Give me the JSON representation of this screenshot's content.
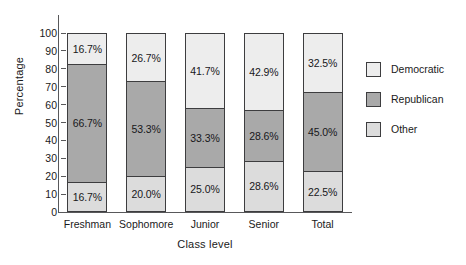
{
  "chart_data": {
    "type": "bar",
    "subtype": "stacked-bar-100-percent",
    "title": "",
    "xlabel": "Class level",
    "ylabel": "Percentage",
    "ylim": [
      0,
      100
    ],
    "yticks": [
      0,
      10,
      20,
      30,
      40,
      50,
      60,
      70,
      80,
      90,
      100
    ],
    "ytick_labels": [
      "0",
      "10",
      "20",
      "30",
      "40",
      "50",
      "60",
      "70",
      "80",
      "90",
      "100"
    ],
    "grid": false,
    "legend_position": "right",
    "categories": [
      "Freshman",
      "Sophomore",
      "Junior",
      "Senior",
      "Total"
    ],
    "series": [
      {
        "name": "Democratic",
        "color": "#ededed",
        "values": [
          16.7,
          26.7,
          41.7,
          42.9,
          32.5
        ],
        "labels": [
          "16.7%",
          "26.7%",
          "41.7%",
          "42.9%",
          "32.5%"
        ]
      },
      {
        "name": "Republican",
        "color": "#a9a9a9",
        "values": [
          66.7,
          53.3,
          33.3,
          28.6,
          45.0
        ],
        "labels": [
          "66.7%",
          "53.3%",
          "33.3%",
          "28.6%",
          "45.0%"
        ]
      },
      {
        "name": "Other",
        "color": "#dcdcdc",
        "values": [
          16.7,
          20.0,
          25.0,
          28.6,
          22.5
        ],
        "labels": [
          "16.7%",
          "20.0%",
          "25.0%",
          "28.6%",
          "22.5%"
        ]
      }
    ],
    "stack_order_top_to_bottom": [
      "Democratic",
      "Republican",
      "Other"
    ]
  },
  "legend": {
    "items": [
      {
        "label": "Democratic",
        "color": "#ededed"
      },
      {
        "label": "Republican",
        "color": "#a9a9a9"
      },
      {
        "label": "Other",
        "color": "#dcdcdc"
      }
    ]
  }
}
